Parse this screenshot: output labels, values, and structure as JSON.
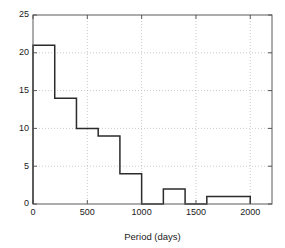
{
  "chart_data": {
    "type": "bar",
    "title": "",
    "subtitle": "",
    "xlabel": "Period (days)",
    "ylabel": "",
    "xlim": [
      0,
      2200
    ],
    "ylim": [
      0,
      25
    ],
    "xticks": [
      0,
      500,
      1000,
      1500,
      2000
    ],
    "xtick_labels": [
      "0",
      "500",
      "1000",
      "1500",
      "2000"
    ],
    "yticks": [
      0,
      5,
      10,
      15,
      20,
      25
    ],
    "ytick_labels": [
      "0",
      "5",
      "10",
      "15",
      "20",
      "25"
    ],
    "grid": true,
    "legend": null,
    "bin_width": 200,
    "bin_edges": [
      0,
      200,
      400,
      600,
      800,
      1000,
      1200,
      1400,
      1600,
      1800,
      2000
    ],
    "categories": [
      "0-200",
      "200-400",
      "400-600",
      "600-800",
      "800-1000",
      "1000-1200",
      "1200-1400",
      "1400-1600",
      "1600-1800",
      "1800-2000"
    ],
    "values": [
      21,
      14,
      10,
      9,
      4,
      0,
      2,
      0,
      1,
      1
    ],
    "bar_style": "outline",
    "colors": {
      "bar_edge": "#2b2b2b",
      "bar_fill": "none",
      "grid": "#b4b4b4",
      "axis": "#5a5a5a",
      "text": "#1a1a1a",
      "background": "#ffffff"
    }
  },
  "figure": {
    "name": "period-histogram",
    "background": "#ffffff"
  }
}
